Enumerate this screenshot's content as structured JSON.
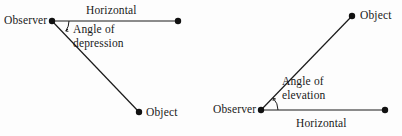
{
  "figure": {
    "background_color": "#fdfdfd",
    "stroke_color": "#1a1a1a",
    "text_color": "#1a1a1a"
  },
  "diagrams": [
    {
      "id": "angle-of-depression",
      "name": "Angle of depression",
      "labels": {
        "observer": "Observer",
        "horizontal": "Horizontal",
        "angle_line1": "Angle of",
        "angle_line2": "depression",
        "angle_full": "Angle of depression",
        "object": "Object"
      },
      "points": {
        "observer": {
          "x": 52,
          "y": 21
        },
        "horizontal_end": {
          "x": 178,
          "y": 21
        },
        "object": {
          "x": 139,
          "y": 112
        }
      },
      "arc": {
        "center_x": 52,
        "center_y": 21,
        "radius": 17,
        "start_angle_deg": 0,
        "end_angle_deg": 36
      }
    },
    {
      "id": "angle-of-elevation",
      "name": "Angle of elevation",
      "labels": {
        "observer": "Observer",
        "horizontal": "Horizontal",
        "angle_line1": "Angle of",
        "angle_line2": "elevation",
        "angle_full": "Angle of elevation",
        "object": "Object"
      },
      "points": {
        "observer": {
          "x": 261,
          "y": 110
        },
        "horizontal_end": {
          "x": 385,
          "y": 110
        },
        "object": {
          "x": 352,
          "y": 16
        }
      },
      "arc": {
        "center_x": 261,
        "center_y": 110,
        "radius": 17,
        "start_angle_deg": 0,
        "end_angle_deg": 43
      }
    }
  ]
}
